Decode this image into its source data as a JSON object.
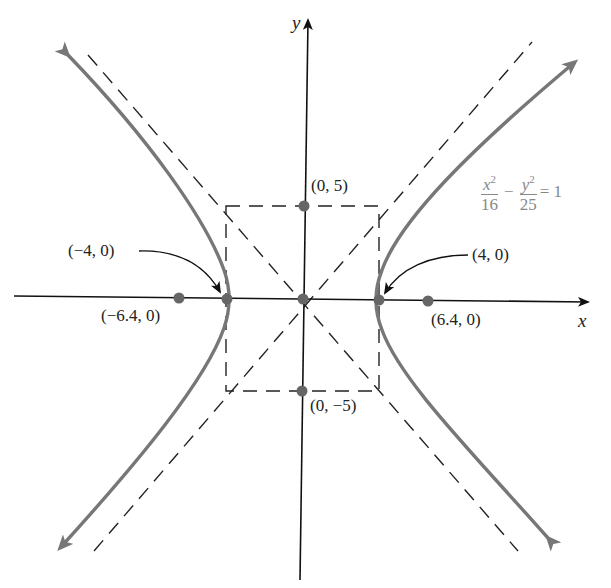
{
  "diagram": {
    "equation": {
      "term1_num": "x",
      "term1_exp": "2",
      "term1_den": "16",
      "operator": "−",
      "term2_num": "y",
      "term2_exp": "2",
      "term2_den": "25",
      "rhs": "= 1"
    },
    "axes": {
      "x_label": "x",
      "y_label": "y"
    },
    "points": [
      {
        "id": "vertex-left",
        "label": "(−4, 0)",
        "x": -4,
        "y": 0
      },
      {
        "id": "vertex-right",
        "label": "(4, 0)",
        "x": 4,
        "y": 0
      },
      {
        "id": "focus-left",
        "label": "(−6.4, 0)",
        "x": -6.4,
        "y": 0
      },
      {
        "id": "focus-right",
        "label": "(6.4, 0)",
        "x": 6.4,
        "y": 0
      },
      {
        "id": "covertex-top",
        "label": "(0, 5)",
        "x": 0,
        "y": 5
      },
      {
        "id": "covertex-bottom",
        "label": "(0, −5)",
        "x": 0,
        "y": -5
      },
      {
        "id": "center",
        "label": "",
        "x": 0,
        "y": 0
      }
    ],
    "colors": {
      "curve": "#777777",
      "axes": "#111111",
      "dashed": "#222222",
      "points": "#666666",
      "equation": "#888888"
    }
  }
}
